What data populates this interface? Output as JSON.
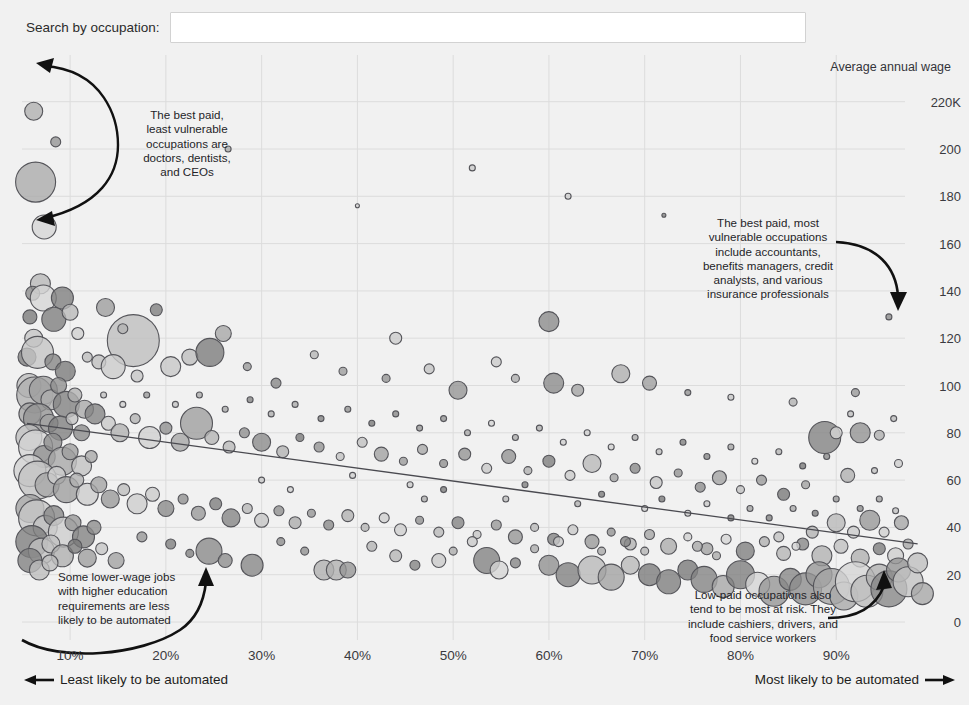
{
  "search": {
    "label": "Search by occupation:",
    "value": "",
    "placeholder": ""
  },
  "chart_data": {
    "type": "scatter",
    "title": "",
    "xlabel": "",
    "ylabel": "Average annual wage",
    "y_axis_title": "Average annual wage",
    "xlim": [
      0.055,
      1.0
    ],
    "ylim": [
      0,
      230
    ],
    "grid": true,
    "legend_position": "none",
    "x_tick_labels": [
      "10%",
      "20%",
      "30%",
      "40%",
      "50%",
      "60%",
      "70%",
      "80%",
      "90%"
    ],
    "x_ticks": [
      0.1,
      0.2,
      0.3,
      0.4,
      0.5,
      0.6,
      0.7,
      0.8,
      0.9
    ],
    "y_tick_labels": [
      "220K",
      "200",
      "180",
      "160",
      "140",
      "120",
      "100",
      "80",
      "60",
      "40",
      "20",
      "0"
    ],
    "y_ticks": [
      220,
      200,
      180,
      160,
      140,
      120,
      100,
      80,
      60,
      40,
      20,
      0
    ],
    "axis_note_left": "Least likely to be automated",
    "axis_note_right": "Most likely to be automated",
    "trendline": {
      "x0": 0.055,
      "y0": 84,
      "x1": 0.985,
      "y1": 33
    },
    "bubble_fill": "#9a9a9a",
    "bubble_stroke": "#55555a",
    "grid_color": "#dcdcdc",
    "background": "#f1f1f1",
    "points": [
      [
        0.062,
        216,
        9
      ],
      [
        0.085,
        203,
        5
      ],
      [
        0.064,
        186,
        20
      ],
      [
        0.073,
        167,
        12
      ],
      [
        0.069,
        143,
        10
      ],
      [
        0.265,
        200,
        3
      ],
      [
        0.52,
        192,
        3
      ],
      [
        0.62,
        180,
        3
      ],
      [
        0.72,
        172,
        2
      ],
      [
        0.4,
        176,
        2
      ],
      [
        0.955,
        129,
        3
      ],
      [
        0.061,
        139,
        7
      ],
      [
        0.072,
        137,
        13
      ],
      [
        0.092,
        137,
        11
      ],
      [
        0.137,
        133,
        9
      ],
      [
        0.058,
        129,
        7
      ],
      [
        0.083,
        128,
        12
      ],
      [
        0.1,
        131,
        8
      ],
      [
        0.108,
        122,
        6
      ],
      [
        0.062,
        120,
        9
      ],
      [
        0.166,
        119,
        26
      ],
      [
        0.19,
        132,
        6
      ],
      [
        0.155,
        124,
        5
      ],
      [
        0.26,
        122,
        8
      ],
      [
        0.6,
        127,
        10
      ],
      [
        0.44,
        120,
        6
      ],
      [
        0.055,
        112,
        9
      ],
      [
        0.066,
        114,
        16
      ],
      [
        0.082,
        110,
        8
      ],
      [
        0.095,
        106,
        10
      ],
      [
        0.118,
        112,
        5
      ],
      [
        0.13,
        110,
        7
      ],
      [
        0.145,
        108,
        12
      ],
      [
        0.17,
        104,
        6
      ],
      [
        0.205,
        108,
        10
      ],
      [
        0.225,
        112,
        8
      ],
      [
        0.246,
        114,
        14
      ],
      [
        0.285,
        108,
        4
      ],
      [
        0.315,
        101,
        5
      ],
      [
        0.355,
        113,
        4
      ],
      [
        0.385,
        106,
        4
      ],
      [
        0.43,
        103,
        4
      ],
      [
        0.475,
        107,
        5
      ],
      [
        0.505,
        98,
        9
      ],
      [
        0.545,
        110,
        5
      ],
      [
        0.565,
        103,
        4
      ],
      [
        0.605,
        101,
        10
      ],
      [
        0.63,
        98,
        6
      ],
      [
        0.675,
        105,
        9
      ],
      [
        0.705,
        101,
        7
      ],
      [
        0.745,
        97,
        3
      ],
      [
        0.79,
        95,
        3
      ],
      [
        0.855,
        93,
        4
      ],
      [
        0.92,
        97,
        4
      ],
      [
        0.057,
        100,
        12
      ],
      [
        0.063,
        96,
        18
      ],
      [
        0.072,
        98,
        14
      ],
      [
        0.08,
        94,
        10
      ],
      [
        0.088,
        100,
        8
      ],
      [
        0.096,
        92,
        13
      ],
      [
        0.105,
        96,
        7
      ],
      [
        0.115,
        90,
        9
      ],
      [
        0.058,
        88,
        11
      ],
      [
        0.067,
        86,
        15
      ],
      [
        0.078,
        84,
        9
      ],
      [
        0.09,
        82,
        12
      ],
      [
        0.102,
        86,
        6
      ],
      [
        0.112,
        80,
        8
      ],
      [
        0.126,
        88,
        10
      ],
      [
        0.14,
        84,
        7
      ],
      [
        0.152,
        80,
        9
      ],
      [
        0.168,
        86,
        5
      ],
      [
        0.183,
        78,
        11
      ],
      [
        0.2,
        82,
        6
      ],
      [
        0.215,
        76,
        9
      ],
      [
        0.232,
        84,
        16
      ],
      [
        0.248,
        78,
        7
      ],
      [
        0.266,
        74,
        6
      ],
      [
        0.282,
        80,
        5
      ],
      [
        0.3,
        76,
        9
      ],
      [
        0.322,
        72,
        6
      ],
      [
        0.34,
        78,
        4
      ],
      [
        0.36,
        74,
        5
      ],
      [
        0.382,
        70,
        4
      ],
      [
        0.405,
        76,
        5
      ],
      [
        0.425,
        71,
        7
      ],
      [
        0.448,
        68,
        4
      ],
      [
        0.468,
        73,
        5
      ],
      [
        0.49,
        67,
        4
      ],
      [
        0.512,
        71,
        6
      ],
      [
        0.535,
        65,
        5
      ],
      [
        0.558,
        70,
        7
      ],
      [
        0.578,
        64,
        4
      ],
      [
        0.6,
        68,
        6
      ],
      [
        0.622,
        62,
        5
      ],
      [
        0.645,
        67,
        9
      ],
      [
        0.668,
        61,
        4
      ],
      [
        0.69,
        65,
        5
      ],
      [
        0.712,
        59,
        6
      ],
      [
        0.735,
        63,
        4
      ],
      [
        0.758,
        57,
        5
      ],
      [
        0.778,
        61,
        7
      ],
      [
        0.8,
        56,
        4
      ],
      [
        0.822,
        60,
        5
      ],
      [
        0.845,
        54,
        6
      ],
      [
        0.868,
        58,
        4
      ],
      [
        0.888,
        78,
        16
      ],
      [
        0.9,
        80,
        6
      ],
      [
        0.925,
        80,
        10
      ],
      [
        0.945,
        79,
        5
      ],
      [
        0.912,
        62,
        7
      ],
      [
        0.965,
        67,
        4
      ],
      [
        0.057,
        78,
        13
      ],
      [
        0.064,
        74,
        17
      ],
      [
        0.073,
        70,
        11
      ],
      [
        0.082,
        76,
        9
      ],
      [
        0.092,
        68,
        14
      ],
      [
        0.1,
        72,
        8
      ],
      [
        0.112,
        66,
        10
      ],
      [
        0.122,
        70,
        6
      ],
      [
        0.058,
        64,
        16
      ],
      [
        0.066,
        60,
        19
      ],
      [
        0.076,
        58,
        12
      ],
      [
        0.086,
        62,
        9
      ],
      [
        0.096,
        56,
        13
      ],
      [
        0.107,
        60,
        7
      ],
      [
        0.118,
        54,
        11
      ],
      [
        0.13,
        58,
        8
      ],
      [
        0.142,
        52,
        9
      ],
      [
        0.156,
        56,
        6
      ],
      [
        0.17,
        50,
        10
      ],
      [
        0.186,
        54,
        7
      ],
      [
        0.2,
        48,
        8
      ],
      [
        0.218,
        52,
        5
      ],
      [
        0.234,
        46,
        7
      ],
      [
        0.252,
        50,
        6
      ],
      [
        0.268,
        44,
        9
      ],
      [
        0.285,
        48,
        5
      ],
      [
        0.3,
        43,
        7
      ],
      [
        0.318,
        47,
        5
      ],
      [
        0.335,
        42,
        6
      ],
      [
        0.352,
        46,
        4
      ],
      [
        0.37,
        41,
        5
      ],
      [
        0.39,
        45,
        6
      ],
      [
        0.408,
        40,
        4
      ],
      [
        0.428,
        44,
        5
      ],
      [
        0.445,
        39,
        6
      ],
      [
        0.465,
        43,
        4
      ],
      [
        0.485,
        38,
        5
      ],
      [
        0.505,
        42,
        6
      ],
      [
        0.525,
        37,
        4
      ],
      [
        0.545,
        41,
        5
      ],
      [
        0.565,
        36,
        7
      ],
      [
        0.585,
        40,
        4
      ],
      [
        0.605,
        35,
        6
      ],
      [
        0.625,
        39,
        5
      ],
      [
        0.645,
        34,
        7
      ],
      [
        0.665,
        38,
        4
      ],
      [
        0.685,
        33,
        6
      ],
      [
        0.705,
        37,
        5
      ],
      [
        0.725,
        32,
        8
      ],
      [
        0.745,
        36,
        4
      ],
      [
        0.765,
        31,
        6
      ],
      [
        0.785,
        35,
        5
      ],
      [
        0.805,
        30,
        9
      ],
      [
        0.825,
        34,
        5
      ],
      [
        0.845,
        29,
        7
      ],
      [
        0.865,
        33,
        6
      ],
      [
        0.885,
        28,
        10
      ],
      [
        0.905,
        32,
        7
      ],
      [
        0.925,
        27,
        9
      ],
      [
        0.945,
        31,
        6
      ],
      [
        0.962,
        28,
        8
      ],
      [
        0.975,
        33,
        5
      ],
      [
        0.058,
        48,
        14
      ],
      [
        0.065,
        44,
        18
      ],
      [
        0.074,
        40,
        12
      ],
      [
        0.083,
        45,
        10
      ],
      [
        0.093,
        38,
        15
      ],
      [
        0.103,
        42,
        8
      ],
      [
        0.114,
        36,
        11
      ],
      [
        0.125,
        40,
        7
      ],
      [
        0.06,
        34,
        16
      ],
      [
        0.07,
        30,
        13
      ],
      [
        0.08,
        33,
        9
      ],
      [
        0.092,
        28,
        11
      ],
      [
        0.105,
        32,
        7
      ],
      [
        0.118,
        27,
        9
      ],
      [
        0.133,
        31,
        6
      ],
      [
        0.148,
        26,
        8
      ],
      [
        0.245,
        30,
        13
      ],
      [
        0.262,
        26,
        7
      ],
      [
        0.29,
        24,
        11
      ],
      [
        0.365,
        22,
        10
      ],
      [
        0.378,
        22,
        10
      ],
      [
        0.39,
        22,
        8
      ],
      [
        0.44,
        28,
        6
      ],
      [
        0.46,
        24,
        5
      ],
      [
        0.485,
        26,
        7
      ],
      [
        0.535,
        26,
        13
      ],
      [
        0.548,
        22,
        9
      ],
      [
        0.565,
        25,
        5
      ],
      [
        0.6,
        24,
        10
      ],
      [
        0.62,
        20,
        12
      ],
      [
        0.645,
        22,
        14
      ],
      [
        0.665,
        19,
        13
      ],
      [
        0.685,
        24,
        9
      ],
      [
        0.705,
        20,
        11
      ],
      [
        0.725,
        17,
        12
      ],
      [
        0.745,
        22,
        10
      ],
      [
        0.762,
        18,
        13
      ],
      [
        0.782,
        15,
        11
      ],
      [
        0.8,
        20,
        14
      ],
      [
        0.818,
        16,
        12
      ],
      [
        0.835,
        13,
        15
      ],
      [
        0.852,
        18,
        11
      ],
      [
        0.868,
        14,
        16
      ],
      [
        0.882,
        20,
        13
      ],
      [
        0.895,
        15,
        18
      ],
      [
        0.908,
        11,
        14
      ],
      [
        0.92,
        17,
        20
      ],
      [
        0.932,
        13,
        16
      ],
      [
        0.945,
        19,
        13
      ],
      [
        0.955,
        14,
        18
      ],
      [
        0.965,
        22,
        12
      ],
      [
        0.975,
        17,
        15
      ],
      [
        0.985,
        25,
        10
      ],
      [
        0.99,
        12,
        11
      ],
      [
        0.058,
        26,
        12
      ],
      [
        0.068,
        22,
        10
      ],
      [
        0.079,
        25,
        8
      ],
      [
        0.205,
        33,
        5
      ],
      [
        0.225,
        29,
        4
      ],
      [
        0.175,
        36,
        5
      ],
      [
        0.32,
        34,
        4
      ],
      [
        0.345,
        30,
        4
      ],
      [
        0.415,
        32,
        5
      ],
      [
        0.5,
        30,
        4
      ],
      [
        0.52,
        34,
        5
      ],
      [
        0.585,
        31,
        4
      ],
      [
        0.61,
        34,
        5
      ],
      [
        0.655,
        30,
        4
      ],
      [
        0.68,
        34,
        5
      ],
      [
        0.7,
        30,
        4
      ],
      [
        0.755,
        32,
        5
      ],
      [
        0.775,
        28,
        4
      ],
      [
        0.84,
        36,
        5
      ],
      [
        0.858,
        32,
        4
      ],
      [
        0.875,
        38,
        6
      ],
      [
        0.9,
        42,
        9
      ],
      [
        0.918,
        38,
        6
      ],
      [
        0.935,
        43,
        10
      ],
      [
        0.95,
        38,
        5
      ],
      [
        0.968,
        42,
        7
      ],
      [
        0.3,
        60,
        3
      ],
      [
        0.33,
        56,
        3
      ],
      [
        0.395,
        62,
        3
      ],
      [
        0.455,
        58,
        3
      ],
      [
        0.47,
        52,
        3
      ],
      [
        0.49,
        56,
        3
      ],
      [
        0.555,
        52,
        3
      ],
      [
        0.575,
        58,
        3
      ],
      [
        0.63,
        50,
        3
      ],
      [
        0.655,
        54,
        3
      ],
      [
        0.7,
        48,
        3
      ],
      [
        0.718,
        52,
        3
      ],
      [
        0.745,
        46,
        3
      ],
      [
        0.765,
        50,
        3
      ],
      [
        0.79,
        44,
        3
      ],
      [
        0.81,
        48,
        3
      ],
      [
        0.83,
        44,
        3
      ],
      [
        0.855,
        48,
        3
      ],
      [
        0.878,
        46,
        3
      ],
      [
        0.9,
        52,
        3
      ],
      [
        0.925,
        48,
        3
      ],
      [
        0.945,
        52,
        3
      ],
      [
        0.962,
        47,
        3
      ],
      [
        0.135,
        96,
        3
      ],
      [
        0.155,
        92,
        3
      ],
      [
        0.18,
        96,
        3
      ],
      [
        0.21,
        92,
        3
      ],
      [
        0.235,
        96,
        3
      ],
      [
        0.262,
        90,
        3
      ],
      [
        0.288,
        94,
        3
      ],
      [
        0.31,
        88,
        3
      ],
      [
        0.335,
        92,
        3
      ],
      [
        0.362,
        86,
        3
      ],
      [
        0.39,
        90,
        3
      ],
      [
        0.415,
        84,
        3
      ],
      [
        0.44,
        88,
        3
      ],
      [
        0.465,
        82,
        3
      ],
      [
        0.49,
        86,
        3
      ],
      [
        0.515,
        80,
        3
      ],
      [
        0.54,
        84,
        3
      ],
      [
        0.565,
        78,
        3
      ],
      [
        0.59,
        82,
        3
      ],
      [
        0.615,
        76,
        3
      ],
      [
        0.64,
        80,
        3
      ],
      [
        0.665,
        74,
        3
      ],
      [
        0.69,
        78,
        3
      ],
      [
        0.715,
        72,
        3
      ],
      [
        0.74,
        76,
        3
      ],
      [
        0.765,
        70,
        3
      ],
      [
        0.79,
        74,
        3
      ],
      [
        0.815,
        68,
        3
      ],
      [
        0.84,
        72,
        3
      ],
      [
        0.865,
        66,
        3
      ],
      [
        0.89,
        70,
        3
      ],
      [
        0.915,
        88,
        3
      ],
      [
        0.94,
        64,
        3
      ],
      [
        0.96,
        86,
        3
      ]
    ]
  },
  "annotations": {
    "top_left": "The best paid,\nleast vulnerable\noccupations are\ndoctors, dentists,\nand CEOs",
    "top_right": "The best paid, most\nvulnerable occupations\ninclude accountants,\nbenefits managers, credit\nanalysts, and various\ninsurance professionals",
    "bottom_left": "Some lower-wage jobs\nwith higher education\nrequirements are less\nlikely to be automated",
    "bottom_right": "Low-paid occupations also\ntend to be most at risk. They\ninclude cashiers, drivers, and\nfood service workers"
  }
}
